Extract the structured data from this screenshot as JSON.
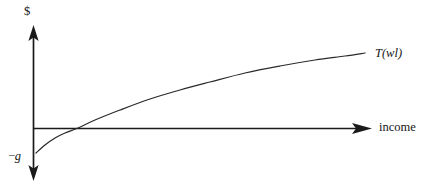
{
  "figure": {
    "background_color": "#ffffff",
    "line_color": "#1a1a1a",
    "curve_color": "#2a2a2a",
    "y_axis_label": "$",
    "x_axis_label": "income",
    "curve_label": "T(wl)",
    "intercept_label_minus": "–",
    "intercept_label_symbol": "g"
  },
  "chart_data": {
    "type": "line",
    "title": "",
    "xlabel": "income",
    "ylabel": "$",
    "grid": false,
    "legend": "none",
    "annotations": [
      {
        "name": "curve-label",
        "text": "T(wl)",
        "style": "italic",
        "at_x": 375,
        "at_y": 47
      },
      {
        "name": "y-intercept-label",
        "text": "–g",
        "style": "italic",
        "at_x": 9,
        "at_y": 149
      },
      {
        "name": "y-axis-label",
        "text": "$",
        "style": "roman",
        "at_x": 24,
        "at_y": 5
      },
      {
        "name": "x-axis-label",
        "text": "income",
        "style": "roman",
        "at_x": 379,
        "at_y": 121
      }
    ],
    "axes": {
      "x_origin_px": 33,
      "y_origin_px": 128,
      "x_axis_from_px": 33,
      "x_axis_to_px": 371,
      "y_axis_from_px": 26,
      "y_axis_to_px": 180,
      "x_arrow": "right",
      "y_arrow_up": true,
      "y_arrow_down": true,
      "xlim_label": "0 to income →",
      "ylim_label": "–g to $ ↑"
    },
    "series": [
      {
        "name": "T(wl)",
        "description": "Concave increasing tax schedule starting below zero at –g, crossing the income axis at the break-even income, then rising with diminishing slope.",
        "shape": "concave-increasing",
        "y_intercept_label": "–g",
        "points_px": [
          [
            36,
            153
          ],
          [
            45,
            145
          ],
          [
            55,
            138
          ],
          [
            65,
            133
          ],
          [
            78,
            128
          ],
          [
            95,
            120
          ],
          [
            120,
            110
          ],
          [
            150,
            99
          ],
          [
            180,
            90
          ],
          [
            210,
            82
          ],
          [
            245,
            73
          ],
          [
            280,
            66
          ],
          [
            315,
            60
          ],
          [
            345,
            56
          ],
          [
            365,
            53
          ]
        ],
        "x_intercept_px": 78,
        "start_px": [
          36,
          153
        ],
        "end_px": [
          365,
          53
        ]
      }
    ]
  }
}
